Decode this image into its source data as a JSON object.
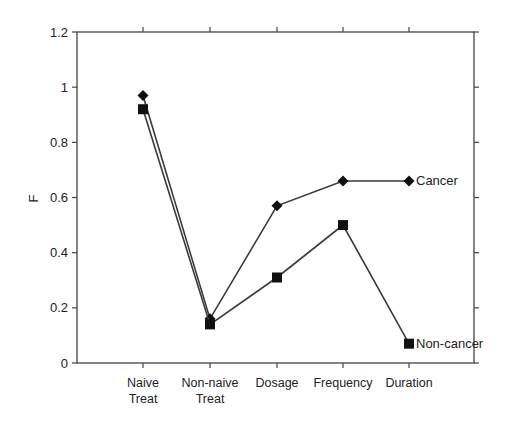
{
  "chart_data": {
    "type": "line",
    "title": "",
    "xlabel": "",
    "ylabel": "F",
    "ylim": [
      0,
      1.2
    ],
    "yticks": [
      0,
      0.2,
      0.4,
      0.6,
      0.8,
      1,
      1.2
    ],
    "ytick_labels": [
      "0",
      "0.2",
      "0.4",
      "0.6",
      "0.8",
      "1",
      "1.2"
    ],
    "categories": [
      [
        "Naive",
        "Treat"
      ],
      [
        "Non-naive",
        "Treat"
      ],
      [
        "Dosage"
      ],
      [
        "Frequency"
      ],
      [
        "Duration"
      ]
    ],
    "grid": false,
    "legend": "inline labels at end of each series",
    "series": [
      {
        "name": "Cancer",
        "marker": "diamond",
        "values": [
          0.97,
          0.16,
          0.57,
          0.66,
          0.66
        ]
      },
      {
        "name": "Non-cancer",
        "marker": "square",
        "values": [
          0.92,
          0.14,
          0.31,
          0.5,
          0.07
        ]
      }
    ]
  },
  "colors": {
    "line": "#3a3a3a",
    "marker": "#111111",
    "axis": "#444444"
  }
}
